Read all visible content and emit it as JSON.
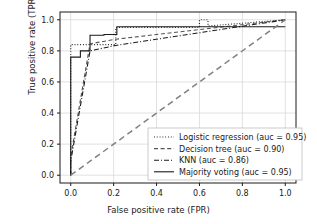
{
  "chart_data": {
    "type": "line",
    "title": "",
    "xlabel": "False positive rate (FPR)",
    "ylabel": "True positive rate (TPR)",
    "xlim": [
      -0.05,
      1.05
    ],
    "ylim": [
      -0.05,
      1.05
    ],
    "xticks": [
      "0.0",
      "0.2",
      "0.4",
      "0.6",
      "0.8",
      "1.0"
    ],
    "xtick_values": [
      0.0,
      0.2,
      0.4,
      0.6,
      0.8,
      1.0
    ],
    "yticks": [
      "0.0",
      "0.2",
      "0.4",
      "0.6",
      "0.8",
      "1.0"
    ],
    "ytick_values": [
      0.0,
      0.2,
      0.4,
      0.6,
      0.8,
      1.0
    ],
    "grid": true,
    "legend_position": "lower right",
    "series": [
      {
        "name": "Logistic regression (auc = 0.95)",
        "label": "Logistic regression (auc = 0.95)",
        "auc": 0.95,
        "linestyle": "dotted",
        "color": "#1a1a1a",
        "x": [
          0.0,
          0.0,
          0.02,
          0.21,
          0.21,
          0.6,
          0.6,
          0.64,
          0.64,
          1.0
        ],
        "y": [
          0.0,
          0.84,
          0.84,
          0.84,
          0.95,
          0.95,
          1.0,
          1.0,
          0.96,
          1.0
        ]
      },
      {
        "name": "Decision tree (auc = 0.90)",
        "label": "Decision tree (auc = 0.90)",
        "auc": 0.9,
        "linestyle": "dashed",
        "color": "#555555",
        "x": [
          0.0,
          0.0,
          0.09,
          0.21,
          1.0
        ],
        "y": [
          0.0,
          0.12,
          0.845,
          0.875,
          1.0
        ]
      },
      {
        "name": "KNN (auc = 0.86)",
        "label": "KNN (auc = 0.86)",
        "auc": 0.86,
        "linestyle": "dashdot",
        "color": "#1a1a1a",
        "x": [
          0.0,
          0.0,
          0.09,
          0.21,
          1.0
        ],
        "y": [
          0.0,
          0.09,
          0.8,
          0.835,
          1.0
        ]
      },
      {
        "name": "Majority voting (auc = 0.95)",
        "label": "Majority voting (auc = 0.95)",
        "auc": 0.95,
        "linestyle": "solid",
        "color": "#1a1a1a",
        "x": [
          0.0,
          0.0,
          0.045,
          0.045,
          0.09,
          0.09,
          0.155,
          0.155,
          0.215,
          0.215,
          1.0
        ],
        "y": [
          0.0,
          0.76,
          0.76,
          0.8,
          0.8,
          0.9,
          0.9,
          0.905,
          0.905,
          0.955,
          0.955
        ]
      },
      {
        "name": "random-baseline",
        "label": "",
        "auc": 0.5,
        "linestyle": "dashed",
        "color": "#808080",
        "x": [
          0.0,
          1.0
        ],
        "y": [
          0.0,
          1.0
        ]
      }
    ]
  },
  "legend": {
    "entries": [
      {
        "label": "Logistic regression (auc = 0.95)",
        "style": "dotted"
      },
      {
        "label": "Decision tree (auc = 0.90)",
        "style": "dashed"
      },
      {
        "label": "KNN (auc = 0.86)",
        "style": "dashdot"
      },
      {
        "label": "Majority voting (auc = 0.95)",
        "style": "solid"
      }
    ]
  },
  "axes": {
    "xlabel": "False positive rate (FPR)",
    "ylabel": "True positive rate (TPR)"
  },
  "colors": {
    "axis": "#1a1a1a",
    "grid": "#d9d9d9",
    "baseline": "#808080",
    "background": "#ffffff"
  }
}
